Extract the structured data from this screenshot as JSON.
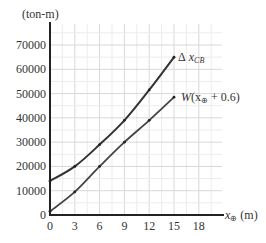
{
  "chart_data": {
    "type": "line",
    "title": "",
    "xlabel": "x⊕ (m)",
    "ylabel": "(ton-m)",
    "xlim": [
      0,
      19
    ],
    "ylim": [
      0,
      75000
    ],
    "grid": true,
    "x_ticks": [
      0,
      3,
      6,
      9,
      12,
      15,
      18
    ],
    "y_ticks": [
      0,
      10000,
      20000,
      30000,
      40000,
      50000,
      60000,
      70000
    ],
    "x": [
      0,
      3,
      6,
      9,
      12,
      15
    ],
    "series": [
      {
        "name": "Δ x_CB",
        "values": [
          14000,
          20000,
          29000,
          39000,
          51500,
          65000
        ]
      },
      {
        "name": "W(x⊕ + 0.6)",
        "values": [
          1500,
          9500,
          20000,
          30000,
          39000,
          48500
        ]
      }
    ],
    "annotations": [
      {
        "text": "Δ x_CB",
        "series": 0
      },
      {
        "text": "W(x⊕ + 0.6)",
        "series": 1
      }
    ],
    "legend_position": "inline-at-line-ends"
  },
  "labels": {
    "y_unit": "(ton-m)",
    "x_unit_var": "x",
    "x_unit_sub": "⊕",
    "x_unit_rest": " (m)",
    "series0_delta": "Δ",
    "series0_x": "x",
    "series0_sub": "CB",
    "series1_W": "W",
    "series1_open": "(x",
    "series1_sub": "⊕",
    "series1_rest": " + 0.6)"
  },
  "ticks": {
    "x": [
      "0",
      "3",
      "6",
      "9",
      "12",
      "15",
      "18"
    ],
    "y": [
      "0",
      "10000",
      "20000",
      "30000",
      "40000",
      "50000",
      "60000",
      "70000"
    ]
  }
}
